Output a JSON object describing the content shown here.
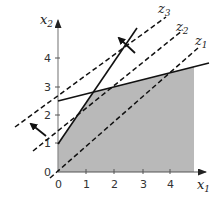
{
  "diagram": {
    "type": "linear-programming-feasible-region",
    "axes": {
      "x_label": "x",
      "x_sub": "1",
      "y_label": "x",
      "y_sub": "2",
      "x_ticks": [
        "0",
        "1",
        "2",
        "3",
        "4"
      ],
      "y_ticks": [
        "0",
        "1",
        "2",
        "3",
        "4"
      ]
    },
    "objective_lines": [
      {
        "label": "z",
        "sub": "1"
      },
      {
        "label": "z",
        "sub": "2"
      },
      {
        "label": "z",
        "sub": "3"
      }
    ],
    "colors": {
      "feasible_fill": "#b9b9b9",
      "line": "#111111",
      "axis": "#555555"
    }
  }
}
